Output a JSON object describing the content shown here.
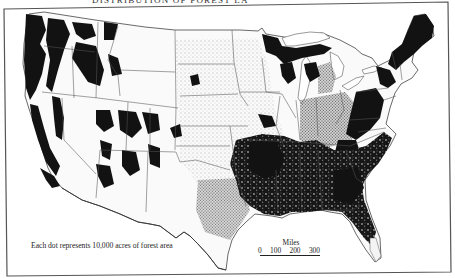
{
  "map": {
    "title_partial": "DISTRIBUTION OF FOREST LA",
    "subject": "Forest area of the conterminous United States (dot-density)",
    "legend": {
      "text": "Each dot represents 10,000 acres of forest area",
      "dot_value_acres": 10000
    },
    "scale": {
      "title": "Miles",
      "ticks": [
        "0",
        "100",
        "200",
        "300"
      ]
    },
    "colors": {
      "background": "#ffffff",
      "forest": "#111111",
      "boundary": "#333333",
      "frame": "#444444"
    },
    "dense_forest_regions": [
      "Pacific Northwest (Washington, Oregon coast & Cascades)",
      "Northern California / Sierra Nevada",
      "Northern Rockies (Idaho, western Montana)",
      "Colorado / Utah / Arizona / New Mexico highlands",
      "Great Lakes (northern Minnesota, Wisconsin, Michigan)",
      "New England (Maine, New Hampshire, Vermont)",
      "Appalachians",
      "Southeast coastal plain and Gulf states",
      "Ozarks / East Texas / Arkansas / Louisiana"
    ]
  }
}
